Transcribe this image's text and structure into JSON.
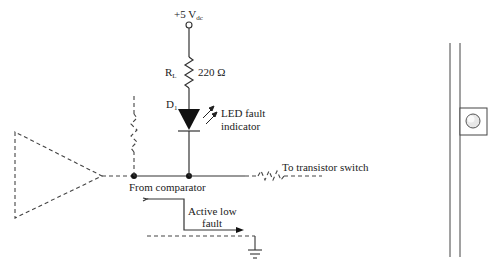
{
  "diagram": {
    "type": "circuit-schematic",
    "supply": {
      "label": "+5 V",
      "subscript": "dc"
    },
    "resistor": {
      "name": "R",
      "subscript": "L",
      "value": "220 Ω"
    },
    "diode": {
      "name": "D",
      "subscript": "1",
      "description_line1": "LED fault",
      "description_line2": "indicator"
    },
    "labels": {
      "to_switch": "To transistor switch",
      "from_comparator": "From comparator",
      "active_low_line1": "Active low",
      "active_low_line2": "fault"
    },
    "colors": {
      "line": "#333333",
      "background": "#ffffff",
      "led_body": "#111111"
    }
  }
}
